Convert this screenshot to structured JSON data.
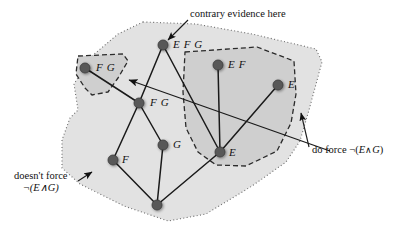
{
  "diagram": {
    "colors": {
      "outer_fill": "#e2e2e2",
      "inner_fill": "#cfcfcf",
      "node_fill": "#595959",
      "edge": "#1a1a1a",
      "text": "#111111",
      "dotted_border": "#6b6b6b",
      "dashed_border": "#2b2b2b"
    },
    "regions": [
      {
        "id": "outer-dotted-region",
        "name": "doesnt-force-region",
        "border_style": "dotted",
        "points": "143,22 196,24 252,34 316,49 322,62 309,110 300,141 286,162 252,186 206,214 168,221 124,206 80,184 62,168 62,140 70,118 78,110 74,84 92,56 118,34"
      },
      {
        "id": "upper-left-dashed-region",
        "name": "fg-force-region",
        "border_style": "dashed",
        "points": "78,56 123,54 128,61 118,78 108,92 92,95 85,88 76,74"
      },
      {
        "id": "right-dashed-region",
        "name": "do-force-region",
        "border_style": "dashed",
        "points": "185,52 257,47 294,61 296,94 291,123 277,151 246,166 216,165 198,152 186,128 183,92"
      }
    ],
    "nodes": [
      {
        "id": "n-efg",
        "name": "node-efg",
        "label": "E F G",
        "x": 163,
        "y": 45,
        "label_dx": 10,
        "label_dy": -7
      },
      {
        "id": "n-fg-top",
        "name": "node-fg-upper",
        "label": "F G",
        "x": 85,
        "y": 68,
        "label_dx": 11,
        "label_dy": -7
      },
      {
        "id": "n-ef",
        "name": "node-ef",
        "label": "E F",
        "x": 218,
        "y": 65,
        "label_dx": 10,
        "label_dy": -7
      },
      {
        "id": "n-e-right",
        "name": "node-e-right",
        "label": "E",
        "x": 278,
        "y": 85,
        "label_dx": 10,
        "label_dy": -7
      },
      {
        "id": "n-fg-mid",
        "name": "node-fg-central",
        "label": "F G",
        "x": 139,
        "y": 103,
        "label_dx": 11,
        "label_dy": -7
      },
      {
        "id": "n-e-bot",
        "name": "node-e-lower",
        "label": "E",
        "x": 220,
        "y": 152,
        "label_dx": 9,
        "label_dy": -6
      },
      {
        "id": "n-g",
        "name": "node-g",
        "label": "G",
        "x": 163,
        "y": 145,
        "label_dx": 10,
        "label_dy": -7
      },
      {
        "id": "n-f",
        "name": "node-f",
        "label": "F",
        "x": 113,
        "y": 160,
        "label_dx": 9,
        "label_dy": -7
      },
      {
        "id": "n-bottom",
        "name": "node-bottom-empty",
        "label": "",
        "x": 157,
        "y": 205,
        "label_dx": 0,
        "label_dy": 0
      }
    ],
    "edges": [
      {
        "name": "edge-efg-fgmid",
        "from": "n-efg",
        "to": "n-fg-mid"
      },
      {
        "name": "edge-efg-ebot",
        "from": "n-efg",
        "to": "n-e-bot"
      },
      {
        "name": "edge-fgtop-fgmid",
        "from": "n-fg-top",
        "to": "n-fg-mid"
      },
      {
        "name": "edge-ef-ebot",
        "from": "n-ef",
        "to": "n-e-bot"
      },
      {
        "name": "edge-eright-ebot",
        "from": "n-e-right",
        "to": "n-e-bot"
      },
      {
        "name": "edge-fgmid-g",
        "from": "n-fg-mid",
        "to": "n-g"
      },
      {
        "name": "edge-fgmid-f",
        "from": "n-fg-mid",
        "to": "n-f"
      },
      {
        "name": "edge-f-bottom",
        "from": "n-f",
        "to": "n-bottom"
      },
      {
        "name": "edge-g-bottom",
        "from": "n-g",
        "to": "n-bottom"
      },
      {
        "name": "edge-ebot-bottom",
        "from": "n-e-bot",
        "to": "n-bottom"
      }
    ],
    "annotations": [
      {
        "id": "a-contrary",
        "name": "annotation-contrary-evidence",
        "text": "contrary evidence here",
        "x": 190,
        "y": 8,
        "leader": {
          "name": "leader-contrary-evidence",
          "x1": 188,
          "y1": 20,
          "x2": 168,
          "y2": 40,
          "arrow": "end"
        }
      },
      {
        "id": "a-doforce",
        "name": "annotation-do-force",
        "text_parts": [
          "do force ¬(",
          "E",
          "∧",
          "G",
          ")"
        ],
        "text": "do force ¬(E∧G)",
        "x": 312,
        "y": 144,
        "leader": {
          "name": "leader-do-force",
          "x1": 309,
          "y1": 147,
          "x2": 301,
          "y2": 113,
          "arrow": "end"
        }
      },
      {
        "id": "a-doesnt",
        "name": "annotation-doesnt-force",
        "line1": "doesn't force",
        "line2": "¬(E∧G)",
        "text": "doesn't force ¬(E∧G)",
        "x": 14,
        "y": 170,
        "leader": {
          "name": "leader-doesnt-force",
          "x1": 78,
          "y1": 181,
          "x2": 92,
          "y2": 172,
          "arrow": "end"
        }
      }
    ],
    "pointer_line": {
      "name": "long-pointer-line-to-fg-region",
      "x1": 330,
      "y1": 151,
      "x2": 129,
      "y2": 80,
      "arrow": "end"
    }
  }
}
